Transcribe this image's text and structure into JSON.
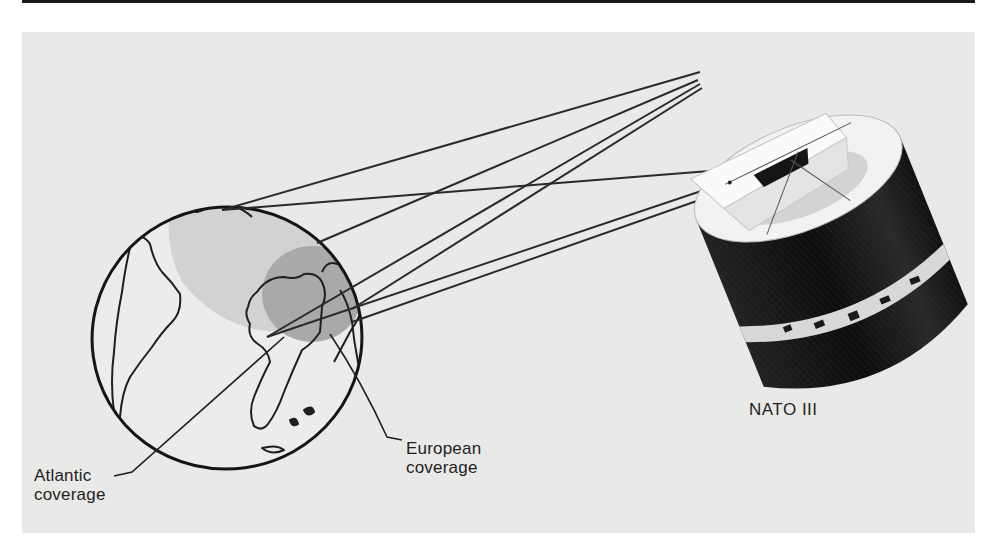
{
  "figure": {
    "labels": {
      "atlantic": {
        "line1": "Atlantic",
        "line2": "coverage"
      },
      "european": {
        "line1": "European",
        "line2": "coverage"
      },
      "satellite": "NATO III"
    },
    "colors": {
      "background": "#e9e9e7",
      "ink": "#1f1f1f",
      "atlantic_coverage_fill": "#d2d2d0",
      "european_coverage_fill": "#a9a9a7",
      "satellite_body": "#151515",
      "satellite_top": "#f2f2f0"
    }
  }
}
